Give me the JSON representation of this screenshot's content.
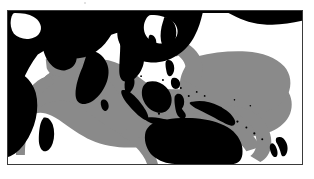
{
  "figure": {
    "title": "",
    "caption": "",
    "type": "distribution-range-map",
    "region": "Indo-Pacific"
  },
  "frame": {
    "border_color": "#3a3a3a",
    "background_color": "#ffffff",
    "x": 7,
    "y": 10,
    "width": 296,
    "height": 155
  },
  "legend": {
    "entries": [
      {
        "key": "land",
        "label": "",
        "color": "#000000"
      },
      {
        "key": "range",
        "label": "",
        "color": "#8a8a8a"
      },
      {
        "key": "ocean",
        "label": "",
        "color": "#ffffff"
      }
    ]
  },
  "colors": {
    "land": "#000000",
    "range": "#8a8a8a",
    "ocean": "#ffffff",
    "border": "#3a3a3a",
    "speck": "#d8d8d8"
  },
  "features": {
    "landmasses": [
      "Asia",
      "Arabian Peninsula",
      "India",
      "Africa",
      "Madagascar",
      "Sri Lanka",
      "Japan",
      "Korea",
      "Indochina",
      "Philippines",
      "Borneo",
      "Sumatra",
      "Java",
      "Sulawesi",
      "New Guinea",
      "Australia",
      "Tasmania",
      "New Zealand",
      "Caspian Sea"
    ],
    "range_description": "Shaded Indo-Pacific distribution spanning East African coast, Red Sea, Arabian Sea, Bay of Bengal, Indonesian archipelago, southern Japan, northern and eastern Australia, and the western and central Pacific islands"
  }
}
